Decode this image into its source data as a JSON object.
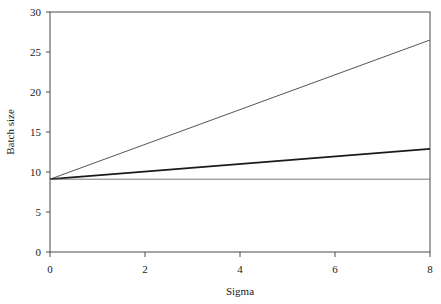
{
  "chart_data": {
    "type": "line",
    "title": "",
    "subtitle": "",
    "xlabel": "Sigma",
    "ylabel": "Batch size",
    "xlim": [
      0,
      8
    ],
    "ylim": [
      0,
      30
    ],
    "xticks": [
      0,
      2,
      4,
      6,
      8
    ],
    "yticks": [
      0,
      5,
      10,
      15,
      20,
      25,
      30
    ],
    "xtick_labels": [
      "0",
      "2",
      "4",
      "6",
      "8"
    ],
    "ytick_labels": [
      "0",
      "5",
      "10",
      "15",
      "20",
      "25",
      "30"
    ],
    "grid": false,
    "legend": "none",
    "box_frame": true,
    "x": [
      0,
      8
    ],
    "series": [
      {
        "name": "steep",
        "x": [
          0,
          8
        ],
        "values": [
          9.1,
          26.5
        ],
        "color": "#555555",
        "width": 1.0,
        "style": "solid"
      },
      {
        "name": "middle",
        "x": [
          0,
          8
        ],
        "values": [
          9.1,
          12.9
        ],
        "color": "#1a1a1a",
        "width": 1.8,
        "style": "solid"
      },
      {
        "name": "flat",
        "x": [
          0,
          8
        ],
        "values": [
          9.1,
          9.1
        ],
        "color": "#6a6a6a",
        "width": 0.9,
        "style": "solid"
      }
    ],
    "axis_color": "#4a4a4a"
  },
  "axes": {
    "x_title": "Sigma",
    "y_title": "Batch size"
  }
}
